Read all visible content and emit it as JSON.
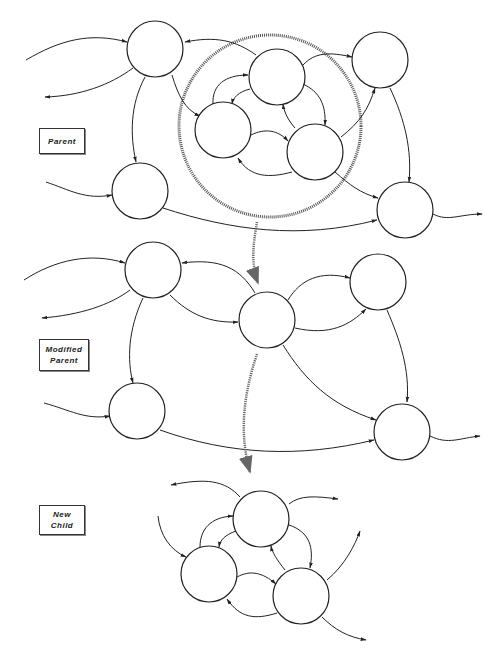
{
  "labels": {
    "parent": "Parent",
    "modified_parent_line1": "Modified",
    "modified_parent_line2": "Parent",
    "new_child_line1": "New",
    "new_child_line2": "Child"
  },
  "diagram": {
    "sections": [
      {
        "name": "Parent",
        "nodes": 7,
        "encircled_subgraph_nodes": 3
      },
      {
        "name": "Modified Parent",
        "nodes": 5
      },
      {
        "name": "New Child",
        "nodes": 3
      }
    ],
    "colors": {
      "stroke": "#222222",
      "hatch": "#555555",
      "background": "#ffffff"
    }
  }
}
